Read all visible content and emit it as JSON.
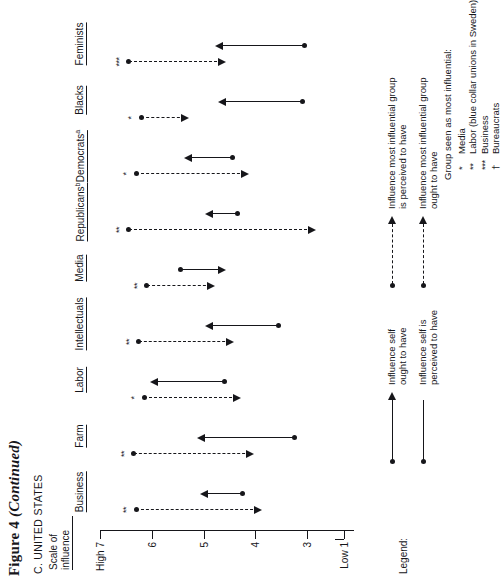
{
  "figure": {
    "title_main": "Figure 4",
    "title_continued": "(Continued)",
    "panel_label": "C. UNITED STATES",
    "axis_title_line1": "Scale of",
    "axis_title_line2": "influence"
  },
  "chart_data": {
    "type": "range",
    "xlabel": "",
    "ylabel": "Scale of influence",
    "ylim": [
      1,
      7
    ],
    "grid": false,
    "legend_position": "below-left",
    "axis_ticks": [
      {
        "value": 7,
        "label": "High 7"
      },
      {
        "value": 6,
        "label": "6"
      },
      {
        "value": 5,
        "label": "5"
      },
      {
        "value": 4,
        "label": "4"
      },
      {
        "value": 3,
        "label": "3"
      },
      {
        "value": 1,
        "label": "Low 1"
      }
    ],
    "axis_has_break_below": 3,
    "categories": [
      "Business",
      "Farm",
      "Labor",
      "Intellectuals",
      "Media",
      "Republicans",
      "Democrats",
      "Blacks",
      "Feminists"
    ],
    "category_superscripts": [
      "",
      "",
      "",
      "",
      "",
      "b",
      "a",
      "",
      ""
    ],
    "significance": [
      "**",
      "**",
      "*",
      "**",
      "**",
      "**",
      "*",
      "*",
      "***"
    ],
    "series": [
      {
        "name": "Influence self (perceived → ought)",
        "style": "solid",
        "from_label": "perceived",
        "to_label": "ought",
        "from": [
          4.25,
          3.25,
          4.6,
          3.55,
          5.45,
          4.35,
          4.45,
          3.1,
          3.05
        ],
        "to": [
          5.0,
          5.05,
          5.95,
          4.9,
          4.65,
          4.9,
          5.3,
          4.65,
          4.7
        ]
      },
      {
        "name": "Influence most influential group (perceived → ought)",
        "style": "dashed",
        "from_label": "perceived",
        "to_label": "ought",
        "from": [
          6.3,
          6.35,
          6.15,
          6.25,
          6.1,
          6.45,
          6.3,
          6.2,
          6.45
        ],
        "to": [
          3.95,
          4.1,
          4.35,
          4.5,
          4.85,
          2.9,
          4.2,
          5.35,
          4.65
        ]
      }
    ]
  },
  "legend": {
    "word": "Legend:",
    "items_left": [
      {
        "symbol": "solid-arrow-with-dot",
        "line1": "Influence self",
        "line2": "ought to have"
      },
      {
        "symbol": "solid-line-with-dot",
        "line1": "Influence self is",
        "line2": "perceived to have"
      }
    ],
    "items_right": [
      {
        "symbol": "dashed-dot-endpoint",
        "line1": "Influence most influential group",
        "line2": "is perceived to have"
      },
      {
        "symbol": "dashed-arrow",
        "line1": "Influence most influential group",
        "line2": "ought to have"
      }
    ],
    "groups_heading": "Group seen as most influential:",
    "groups": [
      {
        "mark": "*",
        "label": "Media"
      },
      {
        "mark": "**",
        "label": "Labor (blue collar unions in Sweden)"
      },
      {
        "mark": "***",
        "label": "Business"
      },
      {
        "mark": "†",
        "label": "Bureaucrats"
      }
    ]
  }
}
